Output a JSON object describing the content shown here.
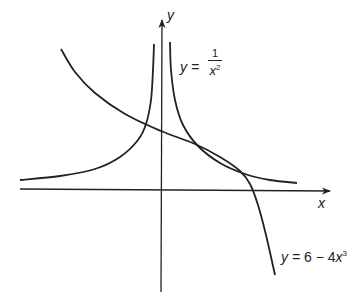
{
  "chart_data": {
    "type": "line",
    "title": "",
    "xlabel": "x",
    "ylabel": "y",
    "grid": false,
    "axes": "cartesian sketch, no tick marks or numeric labels",
    "series": [
      {
        "name": "y = 1/x^2",
        "label": {
          "lhs": "y =",
          "numerator": "1",
          "denominator": "x",
          "exponent": "2"
        },
        "description": "two branches, asymptotic to y-axis and approaching x-axis from above",
        "pixel_points_left_branch": [
          [
            20,
            180
          ],
          [
            60,
            176
          ],
          [
            95,
            169
          ],
          [
            120,
            157
          ],
          [
            138,
            140
          ],
          [
            146,
            124
          ],
          [
            151,
            100
          ],
          [
            153,
            70
          ],
          [
            154,
            44
          ]
        ],
        "pixel_points_right_branch": [
          [
            170,
            42
          ],
          [
            171,
            70
          ],
          [
            175,
            100
          ],
          [
            183,
            125
          ],
          [
            198,
            146
          ],
          [
            220,
            163
          ],
          [
            245,
            174
          ],
          [
            270,
            180
          ],
          [
            297,
            183
          ]
        ]
      },
      {
        "name": "y = 6 - 4x^3",
        "label": {
          "lhs": "y =",
          "rhs": "6 − 4",
          "var": "x",
          "exponent": "3"
        },
        "description": "decreasing cubic crossing y-axis above both branches' intersection region, crossing x-axis to the right",
        "pixel_points": [
          [
            61,
            49
          ],
          [
            75,
            72
          ],
          [
            95,
            93
          ],
          [
            125,
            114
          ],
          [
            161,
            131
          ],
          [
            195,
            144
          ],
          [
            220,
            157
          ],
          [
            240,
            171
          ],
          [
            250,
            184
          ],
          [
            258,
            205
          ],
          [
            266,
            235
          ],
          [
            275,
            275
          ]
        ]
      }
    ],
    "intersections_visible": 3,
    "annotations": [
      "y",
      "x",
      "y = 1/x²",
      "y = 6 − 4x³"
    ]
  },
  "labels": {
    "y_axis": "y",
    "x_axis": "x",
    "curve1_lhs": "y =",
    "curve1_num": "1",
    "curve1_den": "x",
    "curve1_exp": "2",
    "curve2_lhs": "y =",
    "curve2_rhs": "6 − 4",
    "curve2_var": "x",
    "curve2_exp": "3"
  },
  "colors": {
    "ink": "#222222",
    "background": "#ffffff"
  }
}
